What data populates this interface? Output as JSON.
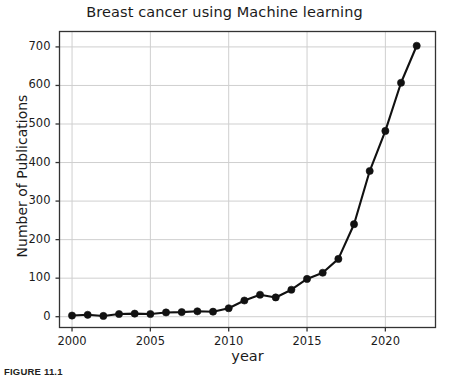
{
  "figure": {
    "caption": "FIGURE 11.1"
  },
  "chart_data": {
    "type": "line",
    "title": "Breast cancer using Machine learning",
    "xlabel": "year",
    "ylabel": "Number of Publications",
    "x": [
      2000,
      2001,
      2002,
      2003,
      2004,
      2005,
      2006,
      2007,
      2008,
      2009,
      2010,
      2011,
      2012,
      2013,
      2014,
      2015,
      2016,
      2017,
      2018,
      2019,
      2020,
      2021,
      2022
    ],
    "values": [
      3,
      5,
      2,
      7,
      8,
      7,
      11,
      12,
      14,
      13,
      22,
      42,
      57,
      50,
      70,
      98,
      114,
      150,
      240,
      378,
      482,
      607,
      703
    ],
    "series": [
      {
        "name": "Number of Publications",
        "values": [
          3,
          5,
          2,
          7,
          8,
          7,
          11,
          12,
          14,
          13,
          22,
          42,
          57,
          50,
          70,
          98,
          114,
          150,
          240,
          378,
          482,
          607,
          703
        ]
      }
    ],
    "xlim": [
      1999.2,
      2023.2
    ],
    "ylim": [
      -28,
      740
    ],
    "xticks": [
      2000,
      2005,
      2010,
      2015,
      2020
    ],
    "xticklabels": [
      "2000",
      "2005",
      "2010",
      "2015",
      "2020"
    ],
    "yticks": [
      0,
      100,
      200,
      300,
      400,
      500,
      600,
      700
    ],
    "yticklabels": [
      "0",
      "100",
      "200",
      "300",
      "400",
      "500",
      "600",
      "700"
    ],
    "grid": true,
    "legend": null,
    "marker": "circle",
    "line_color": "#111111",
    "marker_color": "#111111",
    "grid_color": "#cfcfcf",
    "frame_color": "#333333",
    "background": "#ffffff"
  }
}
